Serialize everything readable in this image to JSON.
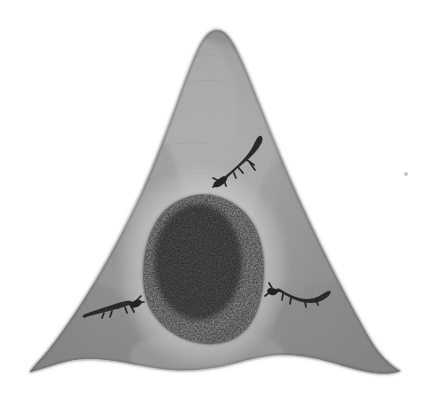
{
  "artwork": {
    "title": "Pencil drawing of a conical rock mound with a dark cave mouth",
    "medium": "graphite pencil / charcoal shading on white paper",
    "subject": "mountain-shaped rock form with cave opening and three lizards",
    "background_color": "#ffffff",
    "alt_text": "A hand-drawn grayscale conical mound with a rounded peak, a large dark oval cave opening near the lower centre, and three small dark lizard-like creatures crawling on its surface."
  },
  "palette": {
    "paper": "#ffffff",
    "rock_light": "#bdbdbd",
    "rock_mid": "#9a9a9a",
    "rock_dark": "#6f6f6f",
    "rock_edge": "#5c5c5c",
    "cave_dark": "#2b2b2b",
    "cave_core": "#1f1f1f",
    "cave_halo": "#c9c9c9",
    "creature": "#262626",
    "speck": "#bcbcbc"
  },
  "elements": {
    "mound": {
      "name": "rock mound",
      "peak_point": "x 215, y 30",
      "base_left": "x 30, y 372",
      "base_right": "x 400, y 371",
      "shading": "lit along the central spine, darkening toward both flanks and the base"
    },
    "cave": {
      "name": "cave opening",
      "center": "x 203, y 267",
      "width": 116,
      "height": 146,
      "shape": "irregular rounded oval, slightly pointed at top"
    },
    "creatures": [
      {
        "id": "lizard-upper-right",
        "position": "x 248, y 160",
        "orientation": "head lower-left, tail curving up to the right",
        "length": 52
      },
      {
        "id": "lizard-lower-left",
        "position": "x 108, y 311",
        "orientation": "head at right with splayed legs, body tapering to the left",
        "length": 48
      },
      {
        "id": "lizard-lower-right",
        "position": "x 302, y 296",
        "orientation": "head at left, body arcing downward then up to the right",
        "length": 56
      }
    ],
    "speck": {
      "name": "stray graphite speck",
      "position": "x 406, y 174",
      "size": 3
    }
  }
}
